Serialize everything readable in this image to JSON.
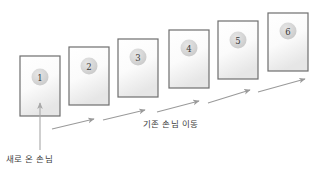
{
  "diagram": {
    "colors": {
      "card_border": "#6e6e6e",
      "card_fill_top": "#fafafa",
      "card_fill_bottom": "#eaeaea",
      "circle_fill": "#d9d9d9",
      "arrow": "#9a9a9a",
      "text": "#3d3d3d",
      "background": "#ffffff"
    },
    "cards": [
      {
        "number": "1",
        "x": 20,
        "y": 56,
        "w": 40,
        "h": 60,
        "cx": 40,
        "cy": 77
      },
      {
        "number": "2",
        "x": 69,
        "y": 47,
        "w": 40,
        "h": 58,
        "cx": 89,
        "cy": 66
      },
      {
        "number": "3",
        "x": 118,
        "y": 39,
        "w": 40,
        "h": 58,
        "cx": 138,
        "cy": 57
      },
      {
        "number": "4",
        "x": 169,
        "y": 30,
        "w": 40,
        "h": 58,
        "cx": 189,
        "cy": 48
      },
      {
        "number": "5",
        "x": 218,
        "y": 21,
        "w": 40,
        "h": 58,
        "cx": 238,
        "cy": 40
      },
      {
        "number": "6",
        "x": 268,
        "y": 13,
        "w": 40,
        "h": 58,
        "cx": 288,
        "cy": 31
      }
    ],
    "flow_arrows": [
      {
        "x1": 52,
        "y1": 129,
        "x2": 94,
        "y2": 119
      },
      {
        "x1": 103,
        "y1": 120,
        "x2": 145,
        "y2": 110
      },
      {
        "x1": 157,
        "y1": 112,
        "x2": 199,
        "y2": 101
      },
      {
        "x1": 208,
        "y1": 103,
        "x2": 250,
        "y2": 90
      },
      {
        "x1": 258,
        "y1": 92,
        "x2": 305,
        "y2": 79
      }
    ],
    "entry_arrow": {
      "x1": 40,
      "y1": 150,
      "x2": 40,
      "y2": 103
    },
    "labels": {
      "new_guest": "새로 온 손님",
      "existing_move": "기존 손님 이동"
    }
  }
}
